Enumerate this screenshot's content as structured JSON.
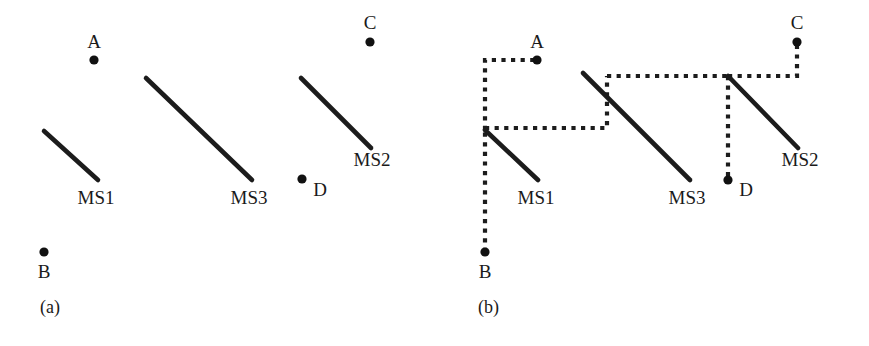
{
  "figure": {
    "width": 869,
    "height": 346,
    "background": "#ffffff",
    "ink_color": "#1c1c1c",
    "dot_color": "#111111"
  },
  "panels": [
    {
      "id": "panel-a",
      "caption": "(a)",
      "caption_pos": {
        "x": 40,
        "y": 313
      },
      "description": "Three mobile sink trajectories and four isolated sensor nodes, no connecting paths",
      "segments": [
        {
          "name": "MS1",
          "x1": 44,
          "y1": 131,
          "x2": 98,
          "y2": 180,
          "label": "MS1",
          "label_x": 96,
          "label_y": 204
        },
        {
          "name": "MS3",
          "x1": 146,
          "y1": 78,
          "x2": 252,
          "y2": 180,
          "label": "MS3",
          "label_x": 249,
          "label_y": 204
        },
        {
          "name": "MS2",
          "x1": 301,
          "y1": 78,
          "x2": 371,
          "y2": 148,
          "label": "MS2",
          "label_x": 372,
          "label_y": 166
        }
      ],
      "nodes": [
        {
          "name": "A",
          "x": 94,
          "y": 60,
          "r": 4.6,
          "label": "A",
          "label_x": 94,
          "label_y": 48
        },
        {
          "name": "B",
          "x": 44,
          "y": 252,
          "r": 4.6,
          "label": "B",
          "label_x": 44,
          "label_y": 278
        },
        {
          "name": "C",
          "x": 370,
          "y": 42,
          "r": 4.6,
          "label": "C",
          "label_x": 370,
          "label_y": 29
        },
        {
          "name": "D",
          "x": 302,
          "y": 179,
          "r": 4.6,
          "label": "D",
          "label_x": 320,
          "label_y": 196
        }
      ],
      "links": []
    },
    {
      "id": "panel-b",
      "caption": "(b)",
      "caption_pos": {
        "x": 478,
        "y": 313
      },
      "description": "Same trajectories and nodes, now joined by dotted relay paths linking B, A, MS1, MS3, MS2, C and D",
      "segments": [
        {
          "name": "MS1",
          "x1": 485,
          "y1": 130,
          "x2": 538,
          "y2": 180,
          "label": "MS1",
          "label_x": 536,
          "label_y": 204
        },
        {
          "name": "MS3",
          "x1": 583,
          "y1": 73,
          "x2": 690,
          "y2": 180,
          "label": "MS3",
          "label_x": 687,
          "label_y": 204
        },
        {
          "name": "MS2",
          "x1": 728,
          "y1": 76,
          "x2": 798,
          "y2": 148,
          "label": "MS2",
          "label_x": 800,
          "label_y": 166
        }
      ],
      "nodes": [
        {
          "name": "A",
          "x": 537,
          "y": 60,
          "r": 4.6,
          "label": "A",
          "label_x": 537,
          "label_y": 48
        },
        {
          "name": "B",
          "x": 485,
          "y": 252,
          "r": 4.6,
          "label": "B",
          "label_x": 485,
          "label_y": 278
        },
        {
          "name": "C",
          "x": 797,
          "y": 42,
          "r": 4.6,
          "label": "C",
          "label_x": 797,
          "label_y": 29
        },
        {
          "name": "D",
          "x": 728,
          "y": 180,
          "r": 4.6,
          "label": "D",
          "label_x": 746,
          "label_y": 196
        }
      ],
      "links": [
        {
          "name": "link-b-to-ms1",
          "from": "B",
          "to": "MS1-start",
          "points": "485,252 485,130"
        },
        {
          "name": "link-ms1-to-a",
          "from": "MS1-start",
          "to": "A",
          "points": "485,130 485,60 537,60"
        },
        {
          "name": "link-ms1-to-ms3",
          "from": "MS1-start",
          "to": "MS3-start",
          "points": "485,128 607,128 607,76"
        },
        {
          "name": "link-ms3-to-ms2",
          "from": "MS3-start",
          "to": "MS2-start",
          "points": "607,76 728,76"
        },
        {
          "name": "link-ms2-to-c",
          "from": "MS2-start",
          "to": "C",
          "points": "728,76 797,76 797,42"
        },
        {
          "name": "link-ms2-to-d",
          "from": "MS2-start",
          "to": "D",
          "points": "728,76 728,180"
        }
      ]
    }
  ],
  "chart_data": {
    "type": "diagram",
    "title": "",
    "legend": [],
    "node_labels": [
      "A",
      "B",
      "C",
      "D"
    ],
    "trajectory_labels": [
      "MS1",
      "MS2",
      "MS3"
    ],
    "panel_captions": [
      "(a)",
      "(b)"
    ]
  }
}
